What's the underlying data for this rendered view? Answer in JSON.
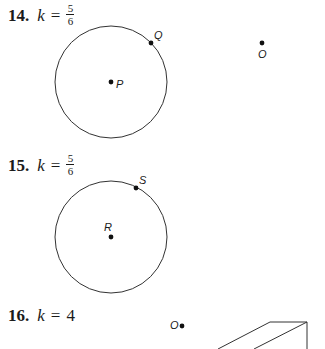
{
  "problems": [
    {
      "number": "14.",
      "var": "k",
      "eq": "=",
      "value_type": "fraction",
      "numerator": "5",
      "denominator": "6",
      "figure": {
        "circle_center_label": "P",
        "circle_point_label": "Q",
        "external_point_label": "O"
      }
    },
    {
      "number": "15.",
      "var": "k",
      "eq": "=",
      "value_type": "fraction",
      "numerator": "5",
      "denominator": "6",
      "figure": {
        "circle_center_label": "R",
        "circle_point_label": "S"
      }
    },
    {
      "number": "16.",
      "var": "k",
      "eq": "=",
      "value_type": "integer",
      "value": "4",
      "figure": {
        "external_point_label": "O",
        "shape": "prism-partial"
      }
    }
  ],
  "colors": {
    "ink": "#1a1a1a",
    "background": "#ffffff"
  }
}
